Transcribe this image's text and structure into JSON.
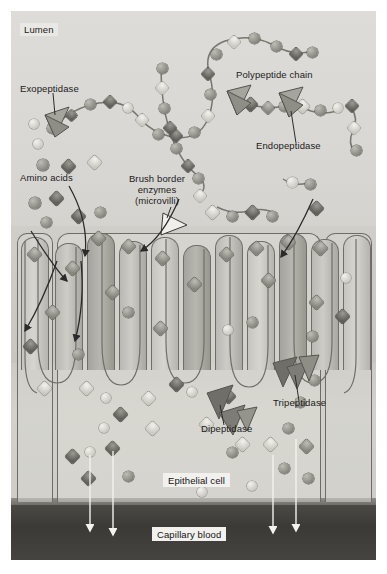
{
  "figure": {
    "domain": "biology-diagram",
    "regions": {
      "lumen": "Lumen",
      "brush_border": "Brush border enzymes (microvilli)",
      "epithelial_cell": "Epithelial cell",
      "capillary_blood": "Capillary blood"
    }
  },
  "labels": {
    "lumen": "Lumen",
    "exopeptidase": "Exopeptidase",
    "amino_acids": "Amino acids",
    "brush_border_line1": "Brush border",
    "brush_border_line2": "enzymes",
    "brush_border_line3": "(microvilli)",
    "polypeptide_chain": "Polypeptide chain",
    "endopeptidase": "Endopeptidase",
    "dipeptidase": "Dipeptidase",
    "tripeptidase": "Tripeptidase",
    "epithelial_cell": "Epithelial cell",
    "capillary_blood": "Capillary blood"
  },
  "colors": {
    "plate_background": "#d9d8d4",
    "lumen": "#dddcd8",
    "brush_border": "#c6c5bf",
    "epithelial_cell": "#d2d1cb",
    "basement_membrane": "#66655f",
    "capillary_blood": "#3b3a36",
    "outline": "#6d6c67",
    "label_text": "#1b1b1b",
    "label_box": "#e9e8e4",
    "white_label_box": "#f2f1ee",
    "arrow_dark": "#2b2b2b",
    "arrow_white": "#f4f3f0"
  },
  "molecule_legend": [
    {
      "name": "amino-acid-sphere-dark",
      "shape": "sphere",
      "tone": "dark"
    },
    {
      "name": "amino-acid-sphere-light",
      "shape": "sphere",
      "tone": "light"
    },
    {
      "name": "amino-acid-diamond-dark",
      "shape": "diamond",
      "tone": "dark"
    },
    {
      "name": "amino-acid-diamond-light",
      "shape": "diamond",
      "tone": "light"
    },
    {
      "name": "peptidase-wedge",
      "shape": "wedge",
      "tone": "mid"
    }
  ],
  "callouts": [
    {
      "name": "exopeptidase",
      "label": "Exopeptidase",
      "points_to": "wedge enzyme cleaving terminal residue of polypeptide chain"
    },
    {
      "name": "endopeptidase",
      "label": "Endopeptidase",
      "points_to": "wedge enzyme cleaving interior bond of polypeptide chain"
    },
    {
      "name": "brush-border-enzymes",
      "label": "Brush border enzymes (microvilli)",
      "points_to": "microvillus surface"
    },
    {
      "name": "dipeptidase",
      "label": "Dipeptidase",
      "points_to": "wedge enzyme inside epithelial cell splitting a dipeptide"
    },
    {
      "name": "tripeptidase",
      "label": "Tripeptidase",
      "points_to": "wedge enzyme inside epithelial cell splitting a tripeptide"
    }
  ],
  "flow_arrows": {
    "uptake_arrows_count": 3,
    "uptake_description": "dark curved arrows from lumen into microvilli / epithelial cell",
    "export_arrows_count": 4,
    "export_description": "white straight arrows from epithelial cell down into capillary blood"
  }
}
